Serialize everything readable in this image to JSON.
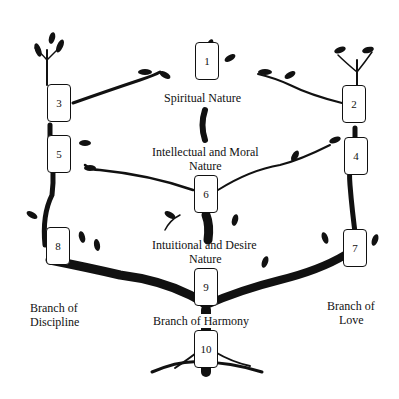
{
  "diagram": {
    "type": "tree-of-life",
    "boxes": [
      {
        "id": "1",
        "label": "1"
      },
      {
        "id": "2",
        "label": "2"
      },
      {
        "id": "3",
        "label": "3"
      },
      {
        "id": "4",
        "label": "4"
      },
      {
        "id": "5",
        "label": "5"
      },
      {
        "id": "6",
        "label": "6"
      },
      {
        "id": "7",
        "label": "7"
      },
      {
        "id": "8",
        "label": "8"
      },
      {
        "id": "9",
        "label": "9"
      },
      {
        "id": "10",
        "label": "10"
      }
    ],
    "labels": {
      "spiritual": "Spiritual Nature",
      "intellectual_line1": "Intellectual and Moral",
      "intellectual_line2": "Nature",
      "intuitional_line1": "Intuitional and Desire",
      "intuitional_line2": "Nature",
      "discipline_line1": "Branch of",
      "discipline_line2": "Discipline",
      "harmony": "Branch of Harmony",
      "love_line1": "Branch of",
      "love_line2": "Love"
    },
    "colors": {
      "ink": "#111111",
      "background": "#ffffff"
    }
  }
}
